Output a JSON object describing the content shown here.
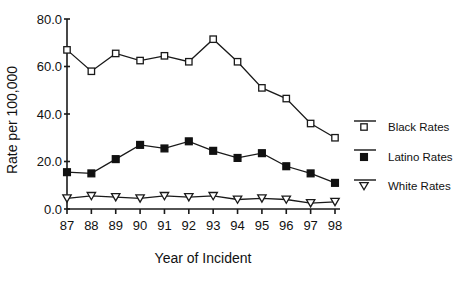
{
  "chart_data": {
    "type": "line",
    "title": "",
    "xlabel": "Year of Incident",
    "ylabel": "Rate per 100,000",
    "categories": [
      "87",
      "88",
      "89",
      "90",
      "91",
      "92",
      "93",
      "94",
      "95",
      "96",
      "97",
      "98"
    ],
    "x": [
      87,
      88,
      89,
      90,
      91,
      92,
      93,
      94,
      95,
      96,
      97,
      98
    ],
    "xlim": [
      87,
      98
    ],
    "ylim": [
      0,
      80
    ],
    "yticks": [
      0,
      20,
      40,
      60,
      80
    ],
    "ytick_labels": [
      "0.0",
      "20.0",
      "40.0",
      "60.0",
      "80.0"
    ],
    "xtick_labels": [
      "87",
      "88",
      "89",
      "90",
      "91",
      "92",
      "93",
      "94",
      "95",
      "96",
      "97",
      "98"
    ],
    "grid": false,
    "legend_position": "right",
    "series": [
      {
        "name": "Black Rates",
        "marker": "open-square",
        "color": "#1a1a1a",
        "values": [
          67.0,
          58.0,
          65.5,
          62.5,
          64.5,
          62.0,
          71.5,
          62.0,
          51.0,
          46.5,
          36.0,
          30.0
        ]
      },
      {
        "name": "Latino Rates",
        "marker": "filled-square",
        "color": "#111111",
        "values": [
          15.5,
          15.0,
          21.0,
          27.0,
          25.5,
          28.5,
          24.5,
          21.5,
          23.5,
          18.0,
          15.0,
          11.0
        ]
      },
      {
        "name": "White Rates",
        "marker": "open-triangle-down",
        "color": "#1a1a1a",
        "values": [
          4.5,
          5.5,
          5.0,
          4.5,
          5.5,
          5.0,
          5.5,
          4.0,
          4.5,
          4.0,
          2.5,
          3.0
        ]
      }
    ]
  },
  "legend": {
    "items": [
      {
        "label": "Black Rates",
        "marker": "open-square"
      },
      {
        "label": "Latino Rates",
        "marker": "filled-square"
      },
      {
        "label": "White Rates",
        "marker": "open-triangle-down"
      }
    ]
  }
}
